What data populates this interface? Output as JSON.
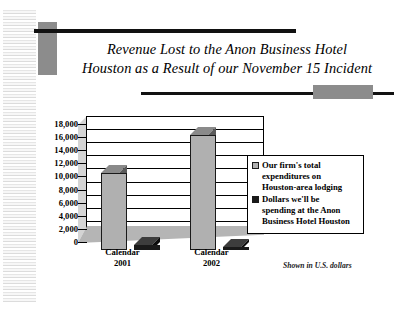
{
  "slide": {
    "title_lines": [
      "Revenue Lost to the Anon Business Hotel",
      "Houston as a Result of our November 15 Incident"
    ],
    "footnote": "Shown in U.S. dollars"
  },
  "colors": {
    "series1": "#b0b0b0",
    "series1_top": "#8a8a8a",
    "series1_side": "#5a5a5a",
    "series2": "#1a1a1a",
    "series2_top": "#3d3d3d",
    "series2_side": "#0d0d0d",
    "accent_gray": "#8c8c8c",
    "rule_black": "#111111",
    "plot_floor": "#b5b5b5",
    "plot_side_wall": "#d4d4d4"
  },
  "chart_data": {
    "type": "bar",
    "title": "Revenue Lost to the Anon Business Hotel Houston as a Result of our November 15 Incident",
    "subtitle": "Shown in U.S. dollars",
    "xlabel": "",
    "ylabel": "",
    "ylim": [
      0,
      18000
    ],
    "yticks": [
      0,
      2000,
      4000,
      6000,
      8000,
      10000,
      12000,
      14000,
      16000,
      18000
    ],
    "ytick_labels": [
      "0",
      "2,000",
      "4,000",
      "6,000",
      "8,000",
      "10,000",
      "12,000",
      "14,000",
      "16,000",
      "18,000"
    ],
    "grid": true,
    "grid_axis": "y",
    "legend_position": "right",
    "three_d": true,
    "categories": [
      "Calendar 2001",
      "Calendar 2002"
    ],
    "category_label_lines": [
      [
        "Calendar",
        "2001"
      ],
      [
        "Calendar",
        "2002"
      ]
    ],
    "series": [
      {
        "name": "Our firm's total expenditures on Houston-area lodging",
        "name_lines": [
          "Our firm's total",
          "expenditures on",
          "Houston-area lodging"
        ],
        "color": "#b0b0b0",
        "values": [
          11800,
          17500
        ]
      },
      {
        "name": "Dollars we'll be spending at the Anon Business Hotel Houston",
        "name_lines": [
          "Dollars we'll be",
          "spending at the Anon",
          "Business Hotel Houston"
        ],
        "color": "#1a1a1a",
        "values": [
          700,
          300
        ]
      }
    ]
  }
}
